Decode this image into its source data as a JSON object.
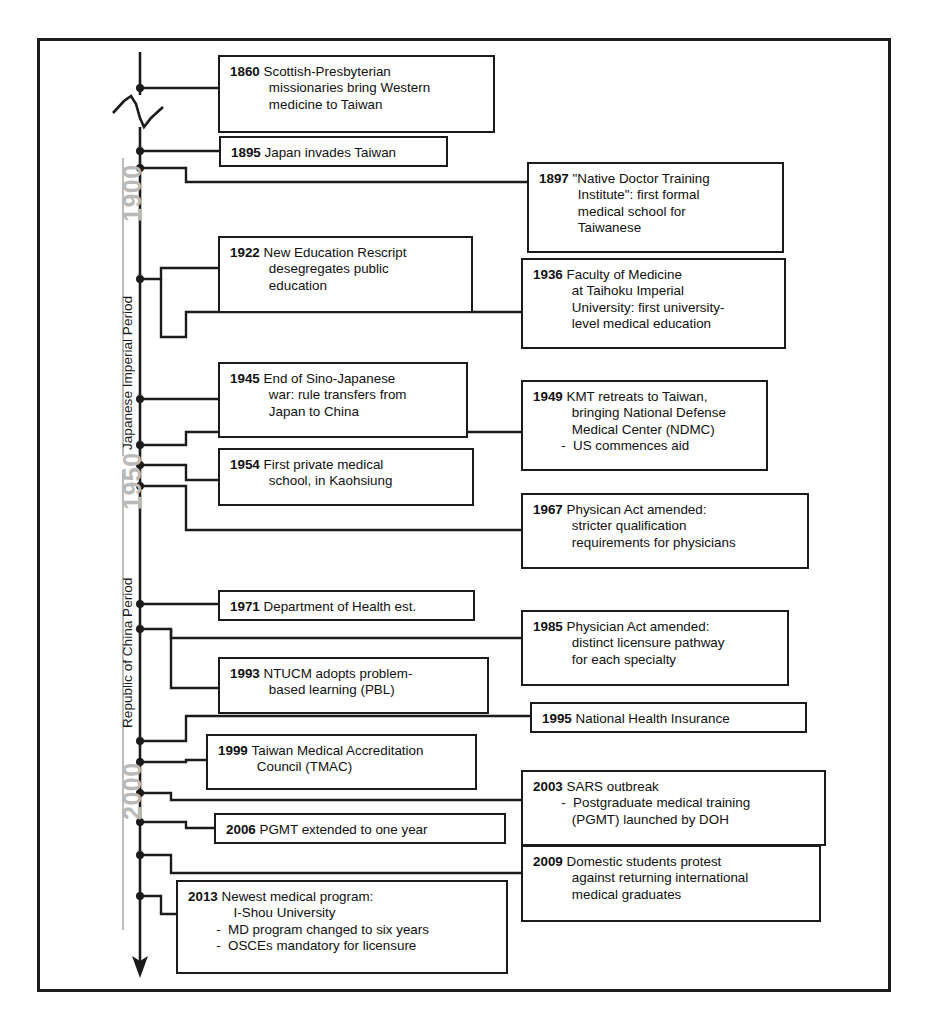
{
  "figure": {
    "type": "timeline",
    "orientation": "vertical-descending",
    "axis_label_color": "#b9b9b9",
    "box_border_color": "#1b1b1b",
    "frame_color": "#1b1b1b"
  },
  "axis": {
    "decade_labels": [
      {
        "text": "1900",
        "year": 1900
      },
      {
        "text": "1950",
        "year": 1950
      },
      {
        "text": "2000",
        "year": 2000
      }
    ],
    "period_labels": [
      {
        "text": "Japanese Imperial Period",
        "start": 1895,
        "end": 1945
      },
      {
        "text": "Republic of China Period",
        "start": 1945,
        "end": 2013
      }
    ],
    "has_break_symbol": true,
    "has_end_arrow": true
  },
  "events": [
    {
      "id": "e1860",
      "year": "1860",
      "side": "left-column",
      "lines": [
        {
          "text": "Scottish-Presbyterian",
          "indent": 0
        },
        {
          "text": "missionaries bring Western",
          "indent": 1
        },
        {
          "text": "medicine to Taiwan",
          "indent": 1
        }
      ]
    },
    {
      "id": "e1895",
      "year": "1895",
      "side": "left-column",
      "lines": [
        {
          "text": "Japan invades Taiwan",
          "indent": 0
        }
      ]
    },
    {
      "id": "e1897",
      "year": "1897",
      "side": "right-column",
      "lines": [
        {
          "text": "\"Native Doctor Training",
          "indent": 0
        },
        {
          "text": "Institute\": first formal",
          "indent": 1
        },
        {
          "text": "medical school for",
          "indent": 1
        },
        {
          "text": "Taiwanese",
          "indent": 1
        }
      ]
    },
    {
      "id": "e1922",
      "year": "1922",
      "side": "left-column",
      "lines": [
        {
          "text": "New Education Rescript",
          "indent": 0
        },
        {
          "text": "desegregates public",
          "indent": 1
        },
        {
          "text": "education",
          "indent": 1
        }
      ]
    },
    {
      "id": "e1936",
      "year": "1936",
      "side": "right-column",
      "lines": [
        {
          "text": "Faculty of Medicine",
          "indent": 0
        },
        {
          "text": "at Taihoku Imperial",
          "indent": 1
        },
        {
          "text": "University: first university-",
          "indent": 1
        },
        {
          "text": "level medical education",
          "indent": 1
        }
      ]
    },
    {
      "id": "e1945",
      "year": "1945",
      "side": "left-column",
      "lines": [
        {
          "text": "End of Sino-Japanese",
          "indent": 0
        },
        {
          "text": "war: rule transfers from",
          "indent": 1
        },
        {
          "text": "Japan to China",
          "indent": 1
        }
      ]
    },
    {
      "id": "e1949",
      "year": "1949",
      "side": "right-column",
      "lines": [
        {
          "text": "KMT retreats to Taiwan,",
          "indent": 0
        },
        {
          "text": "bringing National Defense",
          "indent": 1
        },
        {
          "text": "Medical Center (NDMC)",
          "indent": 1
        },
        {
          "text": "-  US commences aid",
          "indent": 2
        }
      ]
    },
    {
      "id": "e1954",
      "year": "1954",
      "side": "left-column",
      "lines": [
        {
          "text": "First private medical",
          "indent": 0
        },
        {
          "text": "school, in Kaohsiung",
          "indent": 1
        }
      ]
    },
    {
      "id": "e1967",
      "year": "1967",
      "side": "right-column",
      "lines": [
        {
          "text": "Physican Act amended:",
          "indent": 0
        },
        {
          "text": "stricter qualification",
          "indent": 1
        },
        {
          "text": "requirements for physicians",
          "indent": 1
        }
      ]
    },
    {
      "id": "e1971",
      "year": "1971",
      "side": "left-column",
      "lines": [
        {
          "text": "Department of Health est.",
          "indent": 0
        }
      ]
    },
    {
      "id": "e1985",
      "year": "1985",
      "side": "right-column",
      "lines": [
        {
          "text": "Physician Act amended:",
          "indent": 0
        },
        {
          "text": "distinct licensure pathway",
          "indent": 1
        },
        {
          "text": "for each specialty",
          "indent": 1
        }
      ]
    },
    {
      "id": "e1993",
      "year": "1993",
      "side": "left-column",
      "lines": [
        {
          "text": "NTUCM adopts problem-",
          "indent": 0
        },
        {
          "text": "based learning (PBL)",
          "indent": 1
        }
      ]
    },
    {
      "id": "e1995",
      "year": "1995",
      "side": "right-column",
      "lines": [
        {
          "text": "National Health Insurance",
          "indent": 0
        }
      ]
    },
    {
      "id": "e1999",
      "year": "1999",
      "side": "left-column",
      "lines": [
        {
          "text": "Taiwan Medical Accreditation",
          "indent": 0
        },
        {
          "text": "Council (TMAC)",
          "indent": 1
        }
      ]
    },
    {
      "id": "e2003",
      "year": "2003",
      "side": "right-column",
      "lines": [
        {
          "text": "SARS outbreak",
          "indent": 0
        },
        {
          "text": "-  Postgraduate medical training",
          "indent": 2
        },
        {
          "text": "(PGMT) launched by DOH",
          "indent": 1
        }
      ]
    },
    {
      "id": "e2006",
      "year": "2006",
      "side": "left-column",
      "lines": [
        {
          "text": "PGMT extended to one year",
          "indent": 0
        }
      ]
    },
    {
      "id": "e2009",
      "year": "2009",
      "side": "right-column",
      "lines": [
        {
          "text": "Domestic students protest",
          "indent": 0
        },
        {
          "text": "against returning international",
          "indent": 1
        },
        {
          "text": "medical graduates",
          "indent": 1
        }
      ]
    },
    {
      "id": "e2013",
      "year": "2013",
      "side": "left-column",
      "lines": [
        {
          "text": "Newest medical program:",
          "indent": 0
        },
        {
          "text": "I-Shou University",
          "indent": 3
        },
        {
          "text": "-  MD program changed to six years",
          "indent": 2
        },
        {
          "text": "-  OSCEs mandatory for licensure",
          "indent": 2
        }
      ]
    }
  ]
}
